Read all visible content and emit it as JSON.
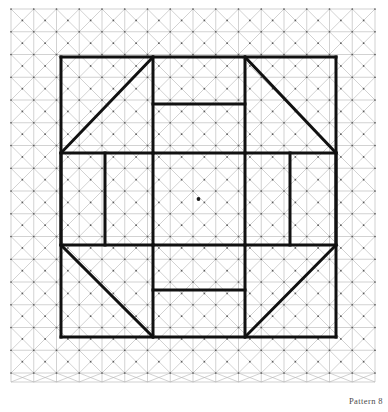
{
  "figure": {
    "title": "Pattern 8",
    "caption": "Pattern 8",
    "type": "geometric-grid-pattern",
    "canvas": {
      "width": 388,
      "height": 412,
      "background": "#ffffff"
    }
  },
  "grid": {
    "name": "triangulated-square-grid",
    "x0": 11,
    "y0": 9,
    "cell": 22.75,
    "cols": 16,
    "rows": 16.4,
    "x1": 375,
    "y1": 382,
    "line_color": "#b4b4b4",
    "line_width": 0.6,
    "diagonals": "both",
    "dot_color": "#595959",
    "dot_radius": 0.85,
    "dots_at": "cell-centers-and-vertices"
  },
  "pattern": {
    "stroke_color": "#111111",
    "stroke_width": 3.0,
    "bounds": {
      "left": 61,
      "top": 57,
      "right": 336,
      "bottom": 337
    },
    "center_dot": {
      "x": 198.5,
      "y": 199,
      "r": 1.9,
      "color": "#1a1a1a"
    },
    "segments": [
      {
        "name": "outer-top",
        "x1": 61,
        "y1": 57,
        "x2": 336,
        "y2": 57
      },
      {
        "name": "outer-left",
        "x1": 61,
        "y1": 57,
        "x2": 61,
        "y2": 337
      },
      {
        "name": "outer-right",
        "x1": 336,
        "y1": 57,
        "x2": 336,
        "y2": 337
      },
      {
        "name": "outer-bottom",
        "x1": 61,
        "y1": 337,
        "x2": 336,
        "y2": 337
      },
      {
        "name": "mid-horizontal-upper",
        "x1": 61,
        "y1": 153,
        "x2": 336,
        "y2": 153
      },
      {
        "name": "mid-horizontal-lower",
        "x1": 61,
        "y1": 245,
        "x2": 336,
        "y2": 245
      },
      {
        "name": "diagonal-top-left",
        "x1": 61,
        "y1": 153,
        "x2": 153,
        "y2": 57
      },
      {
        "name": "diagonal-top-right",
        "x1": 245,
        "y1": 57,
        "x2": 336,
        "y2": 153
      },
      {
        "name": "diagonal-bottom-left",
        "x1": 61,
        "y1": 245,
        "x2": 153,
        "y2": 337
      },
      {
        "name": "diagonal-bottom-right",
        "x1": 245,
        "y1": 337,
        "x2": 336,
        "y2": 245
      },
      {
        "name": "vertical-inner-left-top",
        "x1": 153,
        "y1": 57,
        "x2": 153,
        "y2": 153
      },
      {
        "name": "vertical-inner-right-top",
        "x1": 245,
        "y1": 57,
        "x2": 245,
        "y2": 153
      },
      {
        "name": "notch-top-horizontal",
        "x1": 153,
        "y1": 104,
        "x2": 245,
        "y2": 104
      },
      {
        "name": "vertical-inner-left-bottom",
        "x1": 153,
        "y1": 245,
        "x2": 153,
        "y2": 337
      },
      {
        "name": "vertical-inner-right-bottom",
        "x1": 245,
        "y1": 245,
        "x2": 245,
        "y2": 337
      },
      {
        "name": "notch-bottom-horizontal",
        "x1": 153,
        "y1": 290,
        "x2": 245,
        "y2": 290
      },
      {
        "name": "vertical-mid-left-outer",
        "x1": 61,
        "y1": 153,
        "x2": 61,
        "y2": 245
      },
      {
        "name": "vertical-mid-left-inner",
        "x1": 105,
        "y1": 153,
        "x2": 105,
        "y2": 245
      },
      {
        "name": "vertical-mid-center-left",
        "x1": 153,
        "y1": 153,
        "x2": 153,
        "y2": 245
      },
      {
        "name": "vertical-mid-center-right",
        "x1": 245,
        "y1": 153,
        "x2": 245,
        "y2": 245
      },
      {
        "name": "vertical-mid-right-inner",
        "x1": 290,
        "y1": 153,
        "x2": 290,
        "y2": 245
      },
      {
        "name": "vertical-mid-right-outer",
        "x1": 336,
        "y1": 153,
        "x2": 336,
        "y2": 245
      }
    ]
  }
}
